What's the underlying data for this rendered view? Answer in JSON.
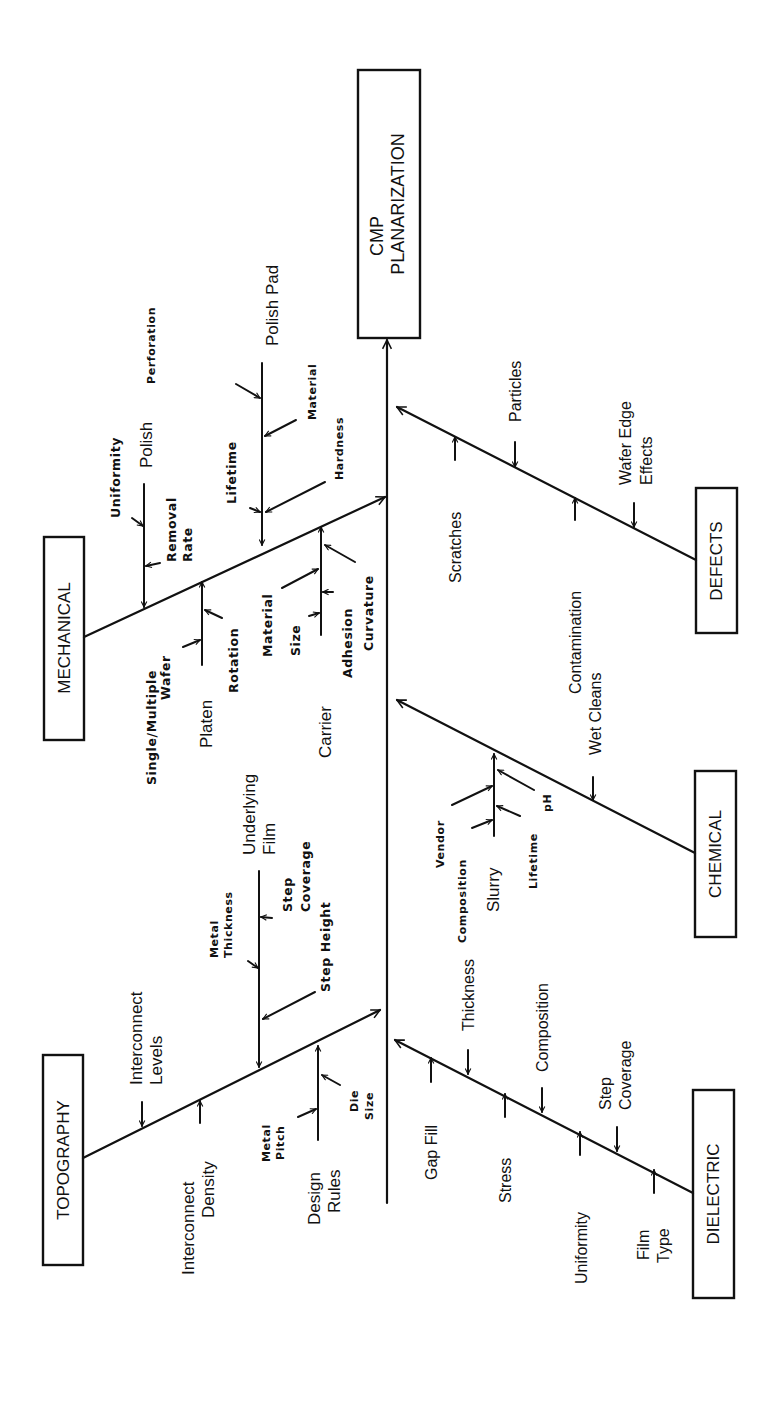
{
  "diagram": {
    "type": "fishbone",
    "orientation": "rotated-90-ccw",
    "effect": {
      "line1": "CMP",
      "line2": "PLANARIZATION"
    },
    "categories": {
      "mechanical": {
        "label": "MECHANICAL",
        "subgroups": {
          "polish": {
            "label": "Polish",
            "causes": [
              "Uniformity",
              "Removal",
              "Rate"
            ]
          },
          "polish_pad": {
            "label": "Polish Pad",
            "causes": [
              "Perforation",
              "Material",
              "Lifetime",
              "Hardness"
            ]
          },
          "platen": {
            "label": "Platen",
            "causes": [
              "Single/Multiple",
              "Wafer",
              "Rotation"
            ]
          },
          "carrier": {
            "label": "Carrier",
            "causes": [
              "Material",
              "Size",
              "Adhesion",
              "Curvature"
            ]
          }
        }
      },
      "topography": {
        "label": "TOPOGRAPHY",
        "causes": {
          "interconnect_levels": [
            "Interconnect",
            "Levels"
          ],
          "interconnect_density": [
            "Interconnect",
            "Density"
          ]
        },
        "subgroups": {
          "underlying_film": {
            "label1": "Underlying",
            "label2": "Film",
            "causes": [
              "Metal",
              "Thickness",
              "Step",
              "Coverage",
              "Step Height"
            ]
          },
          "design_rules": {
            "label1": "Design",
            "label2": "Rules",
            "causes": [
              "Metal",
              "Pitch",
              "Die",
              "Size"
            ]
          }
        }
      },
      "defects": {
        "label": "DEFECTS",
        "causes": {
          "scratches": "Scratches",
          "particles": "Particles",
          "contamination": "Contamination",
          "wafer_edge1": "Wafer Edge",
          "wafer_edge2": "Effects"
        }
      },
      "chemical": {
        "label": "CHEMICAL",
        "causes": {
          "wet_cleans": "Wet Cleans"
        },
        "subgroups": {
          "slurry": {
            "label": "Slurry",
            "causes": [
              "Vendor",
              "Composition",
              "Lifetime",
              "pH"
            ]
          }
        }
      },
      "dielectric": {
        "label": "DIELECTRIC",
        "causes": {
          "gap_fill": "Gap Fill",
          "thickness": "Thickness",
          "stress": "Stress",
          "composition": "Composition",
          "uniformity": "Uniformity",
          "step_coverage1": "Step",
          "step_coverage2": "Coverage",
          "film_type1": "Film",
          "film_type2": "Type"
        }
      }
    },
    "colors": {
      "ink": "#111111",
      "background": "#ffffff"
    }
  }
}
